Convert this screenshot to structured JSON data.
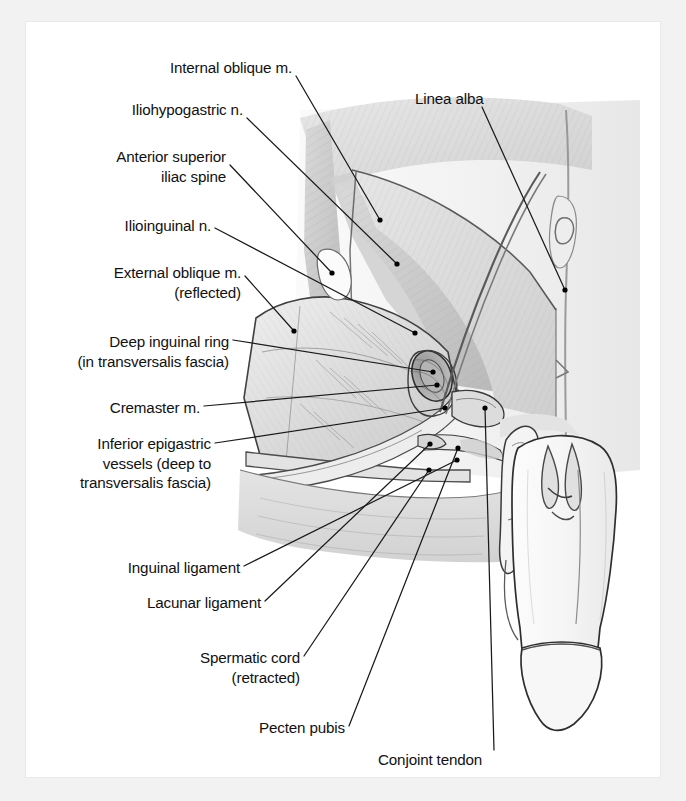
{
  "figure": {
    "type": "anatomical-illustration",
    "style": "grayscale pencil / airbrush medical illustration",
    "border_color": "#f2f2f2",
    "plate_background": "#ffffff",
    "ink_color": "#111111",
    "leader_line_color": "#1a1a1a",
    "leader_dot_color": "#000000"
  },
  "labels": [
    {
      "id": "internal-oblique",
      "text": "Internal oblique m.",
      "lines": [
        "Internal oblique m."
      ],
      "align": "right",
      "x": 292,
      "y": 58,
      "leader": [
        [
          296,
          76
        ],
        [
          380,
          220
        ]
      ],
      "dot": [
        380,
        220
      ]
    },
    {
      "id": "iliohypogastric-nerve",
      "text": "Iliohypogastric n.",
      "lines": [
        "Iliohypogastric n."
      ],
      "align": "right",
      "x": 243,
      "y": 100,
      "leader": [
        [
          247,
          118
        ],
        [
          397,
          264
        ]
      ],
      "dot": [
        397,
        264
      ]
    },
    {
      "id": "anterior-superior-iliac-spine",
      "text": "Anterior superior iliac spine",
      "lines": [
        "Anterior superior",
        "iliac spine"
      ],
      "align": "right",
      "x": 226,
      "y": 147,
      "leader": [
        [
          230,
          165
        ],
        [
          332,
          273
        ]
      ],
      "dot": [
        332,
        273
      ]
    },
    {
      "id": "ilioinguinal-nerve",
      "text": "Ilioinguinal n.",
      "lines": [
        "Ilioinguinal n."
      ],
      "align": "right",
      "x": 211,
      "y": 216,
      "leader": [
        [
          215,
          228
        ],
        [
          415,
          333
        ]
      ],
      "dot": [
        415,
        333
      ]
    },
    {
      "id": "external-oblique",
      "text": "External oblique m. (reflected)",
      "lines": [
        "External oblique m.",
        "(reflected)"
      ],
      "align": "right",
      "x": 241,
      "y": 263,
      "leader": [
        [
          245,
          276
        ],
        [
          294,
          331
        ]
      ],
      "dot": [
        294,
        331
      ]
    },
    {
      "id": "deep-inguinal-ring",
      "text": "Deep inguinal ring (in transversalis fascia)",
      "lines": [
        "Deep inguinal ring",
        "(in transversalis fascia)"
      ],
      "align": "right",
      "x": 229,
      "y": 332,
      "leader": [
        [
          233,
          340
        ],
        [
          433,
          372
        ]
      ],
      "dot": [
        433,
        372
      ]
    },
    {
      "id": "cremaster",
      "text": "Cremaster m.",
      "lines": [
        "Cremaster m."
      ],
      "align": "right",
      "x": 200,
      "y": 398,
      "leader": [
        [
          204,
          406
        ],
        [
          437,
          385
        ]
      ],
      "dot": [
        437,
        385
      ]
    },
    {
      "id": "inferior-epigastric-vessels",
      "text": "Inferior epigastric vessels (deep to transversalis fascia)",
      "lines": [
        "Inferior epigastric",
        "vessels (deep to",
        "transversalis fascia)"
      ],
      "align": "right",
      "x": 211,
      "y": 434,
      "leader": [
        [
          215,
          443
        ],
        [
          445,
          408
        ]
      ],
      "dot": [
        445,
        408
      ]
    },
    {
      "id": "inguinal-ligament",
      "text": "Inguinal ligament",
      "lines": [
        "Inguinal ligament"
      ],
      "align": "right",
      "x": 240,
      "y": 558,
      "leader": [
        [
          244,
          566
        ],
        [
          457,
          460
        ]
      ],
      "dot": [
        457,
        460
      ]
    },
    {
      "id": "lacunar-ligament",
      "text": "Lacunar ligament",
      "lines": [
        "Lacunar ligament"
      ],
      "align": "right",
      "x": 261,
      "y": 593,
      "leader": [
        [
          265,
          601
        ],
        [
          430,
          444
        ]
      ],
      "dot": [
        430,
        444
      ]
    },
    {
      "id": "spermatic-cord",
      "text": "Spermatic cord (retracted)",
      "lines": [
        "Spermatic cord",
        "(retracted)"
      ],
      "align": "right",
      "x": 300,
      "y": 648,
      "leader": [
        [
          304,
          656
        ],
        [
          429,
          470
        ]
      ],
      "dot": [
        429,
        470
      ]
    },
    {
      "id": "pecten-pubis",
      "text": "Pecten pubis",
      "lines": [
        "Pecten pubis"
      ],
      "align": "right",
      "x": 345,
      "y": 718,
      "leader": [
        [
          349,
          726
        ],
        [
          458,
          448
        ]
      ],
      "dot": [
        458,
        448
      ]
    },
    {
      "id": "conjoint-tendon",
      "text": "Conjoint tendon",
      "lines": [
        "Conjoint tendon"
      ],
      "align": "left",
      "x": 378,
      "y": 750,
      "leader": [
        [
          494,
          750
        ],
        [
          485,
          408
        ]
      ],
      "dot": [
        485,
        408
      ]
    },
    {
      "id": "linea-alba",
      "text": "Linea alba",
      "lines": [
        "Linea alba"
      ],
      "align": "left",
      "x": 415,
      "y": 89,
      "leader": [
        [
          482,
          107
        ],
        [
          565,
          290
        ]
      ],
      "dot": [
        565,
        290
      ]
    }
  ]
}
